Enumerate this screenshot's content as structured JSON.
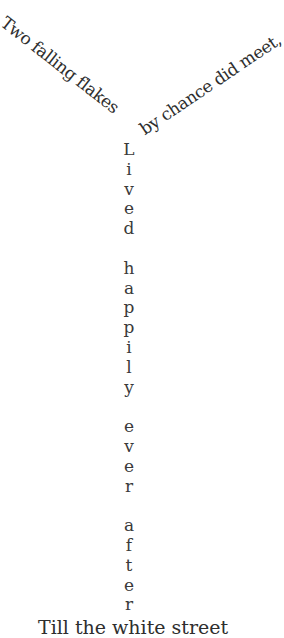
{
  "poem": {
    "line1": "Two falling flakes",
    "line2": "by chance did meet,",
    "vertical_words": [
      {
        "word": "Lived",
        "letters": [
          "L",
          "i",
          "v",
          "e",
          "d"
        ]
      },
      {
        "word": "happily",
        "letters": [
          "h",
          "a",
          "p",
          "p",
          "i",
          "l",
          "y"
        ]
      },
      {
        "word": "ever",
        "letters": [
          "e",
          "v",
          "e",
          "r"
        ]
      },
      {
        "word": "after",
        "letters": [
          "a",
          "f",
          "t",
          "e",
          "r"
        ]
      }
    ],
    "last_line": "Till the white street"
  }
}
